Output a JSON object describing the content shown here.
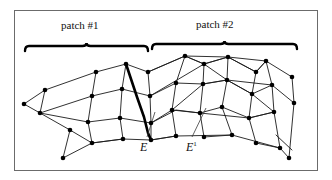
{
  "figure": {
    "type": "mesh-diagram",
    "frame": {
      "stroke": "#6b6b6b",
      "fill": "#ffffff",
      "x": 14,
      "y": 10,
      "width": 303,
      "height": 160
    },
    "colors": {
      "mesh_line": "#1a1a1a",
      "vertex": "#000000",
      "highlight_edge": "#000000",
      "leader_line": "#3a3a3a",
      "brace": "#000000",
      "text": "#111111",
      "background": "#ffffff"
    }
  },
  "braces": [
    {
      "name": "patch-1",
      "label": "patch #1",
      "x1": 25,
      "x2": 148,
      "y": 46,
      "label_x": 61,
      "label_y": 19
    },
    {
      "name": "patch-2",
      "label": "patch #2",
      "x1": 152,
      "x2": 297,
      "y": 44,
      "label_x": 196,
      "label_y": 18
    }
  ],
  "edge_labels": [
    {
      "name": "E",
      "label": "E",
      "sup": "",
      "x": 140,
      "y": 140,
      "leader": {
        "x1": 147,
        "y1": 137,
        "x2": 155,
        "y2": 112
      }
    },
    {
      "name": "E-prime",
      "label": "E",
      "sup": "1",
      "x": 186,
      "y": 140,
      "leader": {
        "x1": 192,
        "y1": 137,
        "x2": 206,
        "y2": 108
      }
    }
  ],
  "mesh": {
    "rows": 4,
    "vertex_radius": 2.3,
    "line_width": 0.9,
    "highlight_line_width": 2.6,
    "vertices": [
      [
        24,
        104
      ],
      [
        45,
        90
      ],
      [
        40,
        113
      ],
      [
        70,
        130
      ],
      [
        63,
        158
      ],
      [
        96,
        72
      ],
      [
        92,
        96
      ],
      [
        88,
        122
      ],
      [
        92,
        143
      ],
      [
        126,
        64
      ],
      [
        122,
        89
      ],
      [
        120,
        118
      ],
      [
        123,
        139
      ],
      [
        148,
        72
      ],
      [
        150,
        96
      ],
      [
        151,
        123
      ],
      [
        151,
        140
      ],
      [
        185,
        56
      ],
      [
        176,
        83
      ],
      [
        172,
        110
      ],
      [
        176,
        136
      ],
      [
        204,
        64
      ],
      [
        203,
        84
      ],
      [
        200,
        113
      ],
      [
        204,
        137
      ],
      [
        228,
        57
      ],
      [
        227,
        80
      ],
      [
        222,
        107
      ],
      [
        232,
        135
      ],
      [
        256,
        72
      ],
      [
        252,
        94
      ],
      [
        249,
        118
      ],
      [
        256,
        143
      ],
      [
        266,
        61
      ],
      [
        272,
        85
      ],
      [
        274,
        112
      ],
      [
        280,
        148
      ],
      [
        292,
        77
      ],
      [
        294,
        103
      ],
      [
        289,
        158
      ]
    ],
    "highlight_path": [
      [
        126,
        64
      ],
      [
        131,
        79
      ],
      [
        137,
        97
      ],
      [
        144,
        117
      ],
      [
        148,
        133
      ],
      [
        151,
        140
      ]
    ],
    "edges_description": "quad-mesh grid of four curved longitudinal rows crossed by transverse rails"
  }
}
